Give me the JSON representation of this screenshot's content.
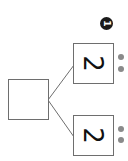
{
  "diagram": {
    "type": "number-bond",
    "badge": {
      "label": "1"
    },
    "whole": {
      "value": ""
    },
    "parts": [
      {
        "value": "2",
        "dots": 2
      },
      {
        "value": "2",
        "dots": 2
      }
    ],
    "colors": {
      "line": "#6e6e6e",
      "dot": "#8a8a8a",
      "badge": "#1a1a1a"
    }
  }
}
